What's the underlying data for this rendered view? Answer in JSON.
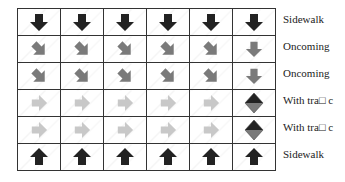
{
  "colors": {
    "dark": "#222222",
    "mid": "#7a7a7a",
    "light": "#c8c8c8",
    "grid": "#333333"
  },
  "rows": [
    {
      "label": "Sidewalk",
      "cells": [
        "down-dark",
        "down-dark",
        "down-dark",
        "down-dark",
        "down-dark",
        "down-dark"
      ]
    },
    {
      "label": "Oncoming",
      "cells": [
        "diag-mid",
        "diag-mid",
        "diag-mid",
        "diag-mid",
        "diag-mid",
        "down-mid"
      ]
    },
    {
      "label": "Oncoming",
      "cells": [
        "diag-mid",
        "diag-mid",
        "diag-mid",
        "diag-mid",
        "diag-mid",
        "down-mid"
      ]
    },
    {
      "label": "With tra\u0000c",
      "cells": [
        "right-light",
        "right-light",
        "right-light",
        "right-light",
        "right-light",
        "diamond"
      ]
    },
    {
      "label": "With tra\u0000c",
      "cells": [
        "right-light",
        "right-light",
        "right-light",
        "right-light",
        "right-light",
        "diamond"
      ]
    },
    {
      "label": "Sidewalk",
      "cells": [
        "up-dark",
        "up-dark",
        "up-dark",
        "up-dark",
        "up-dark",
        "up-dark"
      ]
    }
  ],
  "labels": [
    "Sidewalk",
    "Oncoming",
    "Oncoming",
    "With tra□ c",
    "With tra□ c",
    "Sidewalk"
  ]
}
